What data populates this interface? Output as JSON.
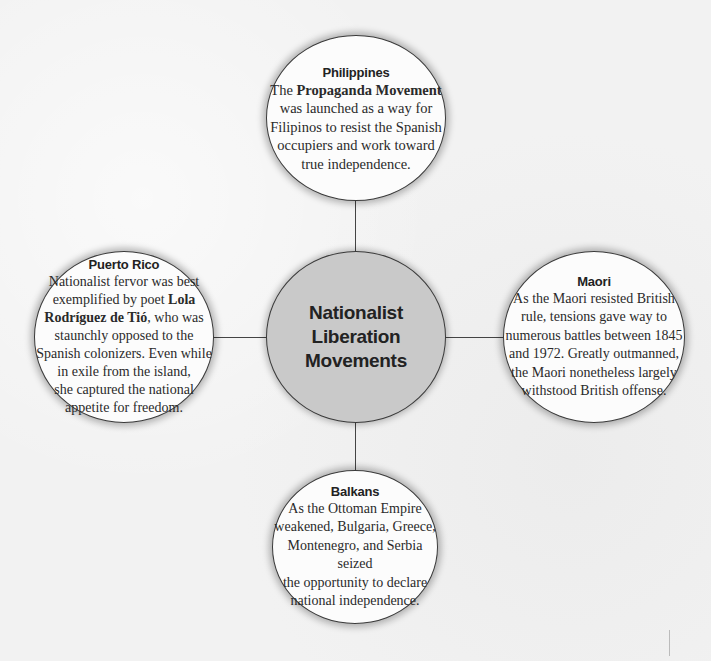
{
  "diagram": {
    "center": {
      "lines": [
        "Nationalist",
        "Liberation",
        "Movements"
      ],
      "fill_color": "#c9c9c9"
    },
    "nodes": [
      {
        "id": "philippines",
        "title": "Philippines",
        "body_parts": [
          {
            "text": "The ",
            "bold": false
          },
          {
            "text": "Propaganda Movement",
            "bold": true
          },
          {
            "text": " was launched as a way for Filipinos to resist the Spanish occupiers and work toward true independence.",
            "bold": false
          }
        ],
        "lines": [
          "The Propaganda Movement",
          "was launched as a way for",
          "Filipinos to resist the Spanish",
          "occupiers and work toward",
          "true independence."
        ]
      },
      {
        "id": "puerto-rico",
        "title": "Puerto Rico",
        "lines": [
          "Nationalist fervor was best",
          "exemplified by poet Lola",
          "Rodríguez de Tió, who was",
          "staunchly opposed to the",
          "Spanish colonizers. Even while",
          "in exile from the island,",
          "she captured the national",
          "appetite for freedom."
        ],
        "bold_phrase": "Lola Rodríguez de Tió"
      },
      {
        "id": "maori",
        "title": "Maori",
        "lines": [
          "As the Maori resisted British",
          "rule, tensions gave way to",
          "numerous battles between 1845",
          "and 1972. Greatly outmanned,",
          "the Maori nonetheless largely",
          "withstood British offense."
        ]
      },
      {
        "id": "balkans",
        "title": "Balkans",
        "lines": [
          "As the Ottoman Empire",
          "weakened, Bulgaria, Greece,",
          "Montenegro, and Serbia seized",
          "the opportunity to declare",
          "national independence."
        ]
      }
    ]
  }
}
